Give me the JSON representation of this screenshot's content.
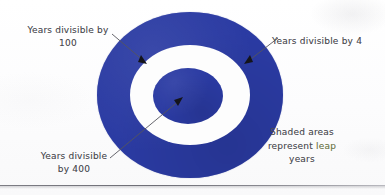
{
  "diagram": {
    "colors": {
      "ring_blue": "#2b3ba3",
      "paper": "#fdfdfd",
      "ink_text": "#4a4a50",
      "leap_word": "#6f7a46",
      "leader_line": "#55555c"
    },
    "rings": [
      {
        "name": "outer-ring",
        "label_ref": "Years divisible by 4",
        "shaded": true
      },
      {
        "name": "middle-gap",
        "label_ref": "Years divisible by 100",
        "shaded": false
      },
      {
        "name": "inner-disc",
        "label_ref": "Years divisible by 400",
        "shaded": true
      }
    ]
  },
  "labels": {
    "divisible_100": "Years divisible by\n100",
    "divisible_4": "Years divisible by 4",
    "divisible_400": "Years  divisible\nby 400",
    "note_line1": "Shaded areas",
    "note_line2_prefix": "represent ",
    "note_line2_highlight": "leap",
    "note_line3": "years"
  },
  "annotations": {
    "arrow_100_target": "middle white ring (years divisible by 100)",
    "arrow_4_target": "outer blue ring (years divisible by 4)",
    "arrow_400_target": "inner blue disc (years divisible by 400)"
  }
}
